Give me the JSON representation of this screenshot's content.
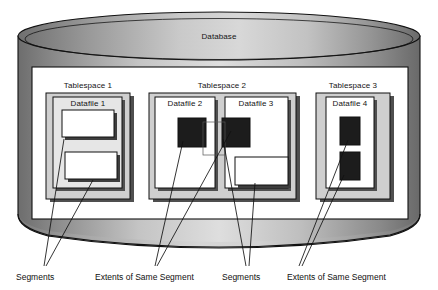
{
  "diagram": {
    "title": "Database",
    "type": "oracle-storage-hierarchy",
    "cylinder_label": "Database",
    "tablespaces": [
      {
        "id": "tablespace-1",
        "label": "Tablespace 1",
        "datafiles": [
          {
            "id": "datafile-1",
            "label": "Datafile 1",
            "blocks": [
              {
                "kind": "segment",
                "fill": "white"
              },
              {
                "kind": "segment",
                "fill": "white"
              }
            ]
          }
        ]
      },
      {
        "id": "tablespace-2",
        "label": "Tablespace 2",
        "datafiles": [
          {
            "id": "datafile-2",
            "label": "Datafile 2",
            "blocks": [
              {
                "kind": "extent",
                "fill": "black"
              }
            ]
          },
          {
            "id": "datafile-3",
            "label": "Datafile 3",
            "blocks": [
              {
                "kind": "extent",
                "fill": "black"
              },
              {
                "kind": "segment",
                "fill": "white"
              }
            ]
          }
        ]
      },
      {
        "id": "tablespace-3",
        "label": "Tablespace 3",
        "datafiles": [
          {
            "id": "datafile-4",
            "label": "Datafile 4",
            "blocks": [
              {
                "kind": "extent",
                "fill": "black"
              },
              {
                "kind": "extent",
                "fill": "black"
              }
            ]
          }
        ]
      }
    ],
    "callouts": [
      {
        "id": "callout-segments-1",
        "text": "Segments"
      },
      {
        "id": "callout-extents-1",
        "text": "Extents of Same Segment"
      },
      {
        "id": "callout-segments-2",
        "text": "Segments"
      },
      {
        "id": "callout-extents-2",
        "text": "Extents of Same Segment"
      }
    ],
    "colors": {
      "cylinder_dark": "#767676",
      "cylinder_light": "#e2e2e2",
      "panel": "#ffffff",
      "tablespace_fill": "#cfcfcf",
      "datafile_fill": "#ffffff",
      "extent_fill": "#1c1c1c",
      "shadow": "#4a4a4a",
      "outline": "#000000"
    }
  }
}
